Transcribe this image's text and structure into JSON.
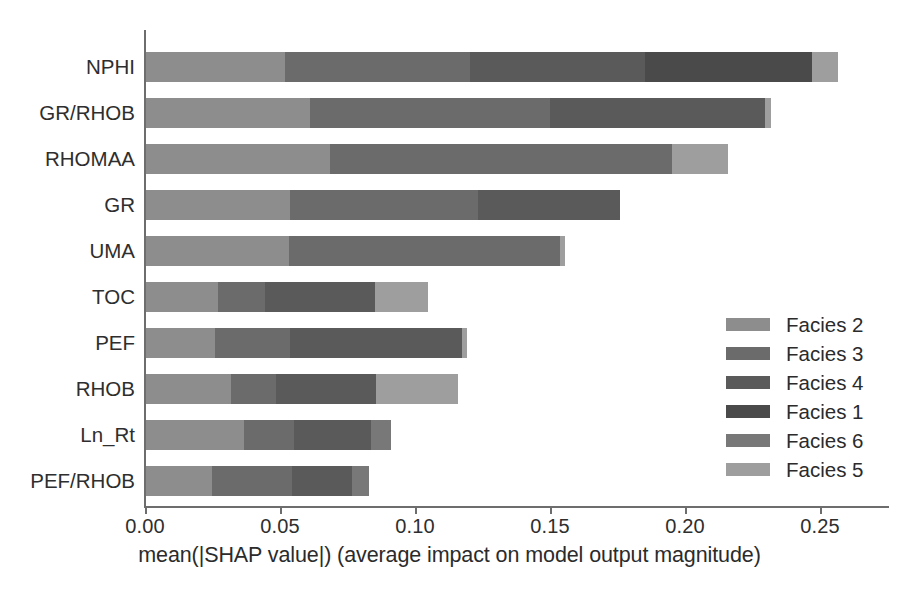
{
  "chart_data": {
    "type": "bar",
    "orientation": "horizontal",
    "stacked": true,
    "title": "",
    "xlabel": "mean(|SHAP value|) (average impact on model output magnitude)",
    "ylabel": "",
    "xlim": [
      0.0,
      0.275
    ],
    "xticks": [
      0.0,
      0.05,
      0.1,
      0.15,
      0.2,
      0.25
    ],
    "xtick_labels": [
      "0.00",
      "0.05",
      "0.10",
      "0.15",
      "0.20",
      "0.25"
    ],
    "grid": false,
    "legend_position": "center right",
    "categories": [
      "NPHI",
      "GR/RHOB",
      "RHOMAA",
      "GR",
      "UMA",
      "TOC",
      "PEF",
      "RHOB",
      "Ln_Rt",
      "PEF/RHOB"
    ],
    "series": [
      {
        "name": "Facies 2",
        "color": "#8d8d8d",
        "values": [
          0.0517,
          0.0609,
          0.0683,
          0.0535,
          0.0528,
          0.0269,
          0.0258,
          0.0314,
          0.0362,
          0.0244
        ]
      },
      {
        "name": "Facies 3",
        "color": "#6b6b6b",
        "values": [
          0.0833,
          0.0886,
          0.1263,
          0.0694,
          0.1004,
          0.0173,
          0.0277,
          0.0166,
          0.0185,
          0.0295
        ]
      },
      {
        "name": "Facies 4",
        "color": "#5a5a5a",
        "values": [
          0.069,
          0.0794,
          0.0,
          0.0524,
          0.0,
          0.0406,
          0.0635,
          0.0369,
          0.0284,
          0.0222
        ]
      },
      {
        "name": "Facies 1",
        "color": "#4a4a4a",
        "values": [
          0.052,
          0.0,
          0.0,
          0.0,
          0.0,
          0.0,
          0.0,
          0.0,
          0.0,
          0.0
        ]
      },
      {
        "name": "Facies 6",
        "color": "#787878",
        "values": [
          0.0,
          0.0,
          0.0,
          0.0,
          0.0,
          0.0,
          0.0,
          0.0,
          0.0074,
          0.0061
        ]
      },
      {
        "name": "Facies 5",
        "color": "#9e9e9e",
        "values": [
          0.0096,
          0.0023,
          0.0207,
          0.0,
          0.0018,
          0.0196,
          0.0019,
          0.0303,
          0.0,
          0.0
        ]
      }
    ],
    "totals": [
      0.2656,
      0.2312,
      0.2153,
      0.1753,
      0.155,
      0.1044,
      0.1189,
      0.1152,
      0.0905,
      0.0822
    ],
    "legend_entries": [
      "Facies 2",
      "Facies 3",
      "Facies 4",
      "Facies 1",
      "Facies 6",
      "Facies 5"
    ]
  },
  "geometry": {
    "x_origin_px": 146,
    "px_per_unit": 2700,
    "row_positions": [
      52,
      98,
      144,
      190,
      236,
      282,
      328,
      374,
      420,
      466
    ],
    "bar_height_px": 30,
    "bar_pixel_spans": [
      [
        [
          146,
          285
        ],
        [
          285,
          470
        ],
        [
          470,
          645
        ],
        [
          645,
          812
        ],
        [
          812,
          812
        ],
        [
          812,
          838
        ]
      ],
      [
        [
          146,
          310
        ],
        [
          310,
          550
        ],
        [
          550,
          765
        ],
        [
          765,
          765
        ],
        [
          765,
          765
        ],
        [
          765,
          771
        ]
      ],
      [
        [
          146,
          330
        ],
        [
          330,
          672
        ],
        [
          672,
          672
        ],
        [
          672,
          672
        ],
        [
          672,
          672
        ],
        [
          672,
          728
        ]
      ],
      [
        [
          146,
          290
        ],
        [
          290,
          478
        ],
        [
          478,
          620
        ],
        [
          620,
          620
        ],
        [
          620,
          620
        ],
        [
          620,
          620
        ]
      ],
      [
        [
          146,
          289
        ],
        [
          289,
          560
        ],
        [
          560,
          560
        ],
        [
          560,
          560
        ],
        [
          560,
          560
        ],
        [
          560,
          565
        ]
      ],
      [
        [
          146,
          218
        ],
        [
          218,
          265
        ],
        [
          265,
          375
        ],
        [
          375,
          375
        ],
        [
          375,
          375
        ],
        [
          375,
          428
        ]
      ],
      [
        [
          146,
          215
        ],
        [
          215,
          290
        ],
        [
          290,
          462
        ],
        [
          462,
          462
        ],
        [
          462,
          462
        ],
        [
          462,
          467
        ]
      ],
      [
        [
          146,
          231
        ],
        [
          231,
          276
        ],
        [
          276,
          376
        ],
        [
          376,
          376
        ],
        [
          376,
          376
        ],
        [
          376,
          458
        ]
      ],
      [
        [
          146,
          244
        ],
        [
          244,
          294
        ],
        [
          294,
          371
        ],
        [
          371,
          371
        ],
        [
          371,
          391
        ],
        [
          391,
          391
        ]
      ],
      [
        [
          146,
          212
        ],
        [
          212,
          292
        ],
        [
          292,
          352
        ],
        [
          352,
          352
        ],
        [
          352,
          369
        ],
        [
          369,
          369
        ]
      ]
    ]
  }
}
